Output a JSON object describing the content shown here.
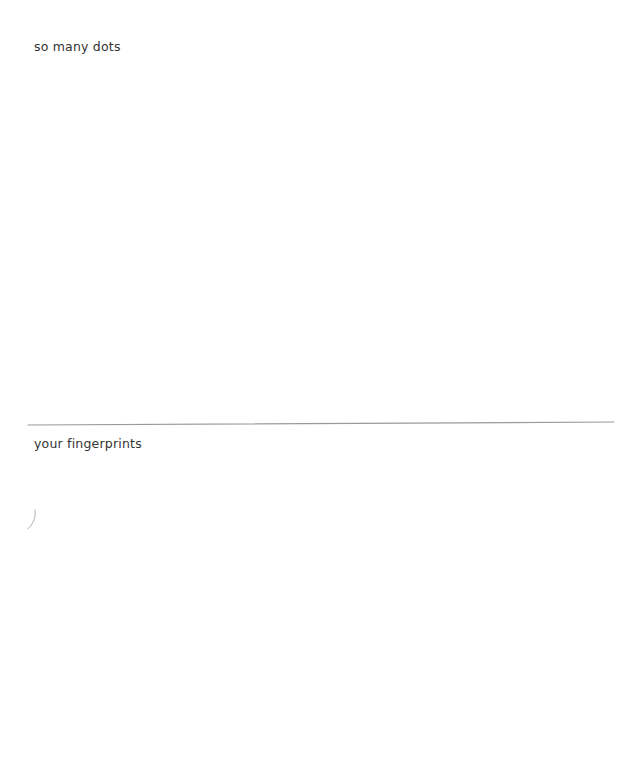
{
  "top_strip": {
    "text": "                                                                                "
  },
  "sections": [
    {
      "label": "so many dots",
      "canvas_name": "dots-canvas"
    },
    {
      "label": "your fingerprints",
      "canvas_name": "fingerprints-canvas"
    }
  ],
  "colors": {
    "background": "#ffffff",
    "label_text": "#333333",
    "divider": "#9a9a9a",
    "stroke": "#b0b0b0"
  }
}
